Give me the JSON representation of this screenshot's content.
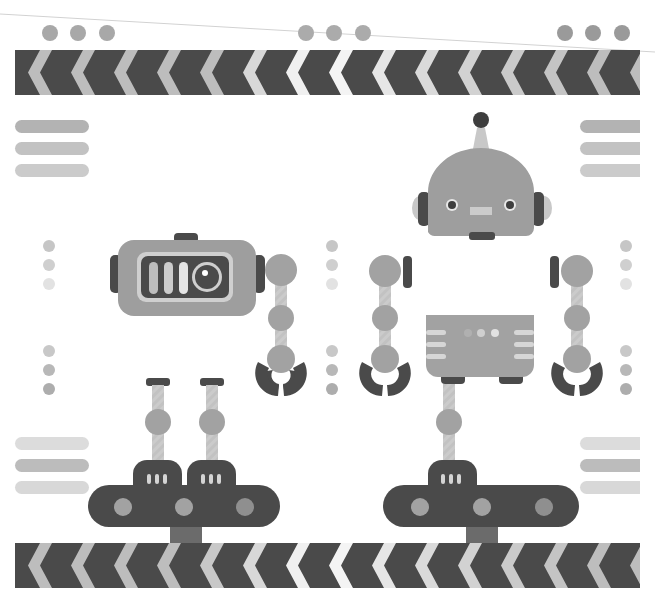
{
  "illustration": {
    "title": "Factory robots on conveyor belts",
    "width": 655,
    "height": 606
  },
  "colors": {
    "background": "#ffffff",
    "dark": "#4a4a4a",
    "mid": "#9c9c9c",
    "light": "#bdbdbd",
    "pale": "#d9d9d9",
    "white": "#f4f4f4",
    "divider_line": "#cfcfcf"
  },
  "stripes": {
    "top": {
      "x": 15,
      "y": 50,
      "width": 625,
      "height": 45,
      "chevron_count": 15
    },
    "bottom": {
      "x": 15,
      "y": 543,
      "width": 625,
      "height": 45,
      "chevron_count": 15
    }
  },
  "top_dots": {
    "groups": [
      {
        "x": [
          50,
          78,
          107
        ],
        "y": 33,
        "r": 8,
        "color": "#a8a8a8"
      },
      {
        "x": [
          306,
          334,
          363
        ],
        "y": 33,
        "r": 8,
        "color": "#a8a8a8"
      },
      {
        "x": [
          565,
          593,
          622
        ],
        "y": 33,
        "r": 8,
        "color": "#9a9a9a"
      }
    ]
  },
  "side_bars": [
    {
      "x": 15,
      "y": 120,
      "w": 74,
      "colors": [
        "#b8b8b8",
        "#c4c4c4",
        "#cccccc"
      ]
    },
    {
      "x": 580,
      "y": 120,
      "w": 60,
      "colors": [
        "#b8b8b8",
        "#c4c4c4",
        "#cccccc"
      ]
    },
    {
      "x": 15,
      "y": 437,
      "w": 74,
      "colors": [
        "#dcdcdc",
        "#bcbcbc",
        "#d8d8d8"
      ]
    },
    {
      "x": 580,
      "y": 437,
      "w": 60,
      "colors": [
        "#dcdcdc",
        "#bcbcbc",
        "#d8d8d8"
      ]
    }
  ],
  "dot_columns": [
    {
      "x": 49,
      "ys": [
        245,
        265,
        285,
        350,
        370,
        390
      ]
    },
    {
      "x": 332,
      "ys": [
        245,
        265,
        285,
        350,
        370,
        390
      ]
    },
    {
      "x": 625,
      "ys": [
        245,
        265,
        285,
        350,
        370,
        390
      ]
    }
  ],
  "robots": {
    "camera_robot": {
      "label": "camera-head robot",
      "x": 110,
      "y": 233
    },
    "round_head_robot": {
      "label": "round-head robot",
      "x": 420,
      "y": 115
    },
    "left_arm": {
      "label": "gripper arm"
    },
    "right_arms": {
      "label": "gripper arms"
    },
    "body_box": {
      "label": "robot body unit"
    }
  },
  "conveyors": [
    {
      "label": "left conveyor",
      "x": 88,
      "y": 485,
      "w": 190,
      "h": 42
    },
    {
      "label": "right conveyor",
      "x": 383,
      "y": 485,
      "w": 195,
      "h": 42
    }
  ]
}
